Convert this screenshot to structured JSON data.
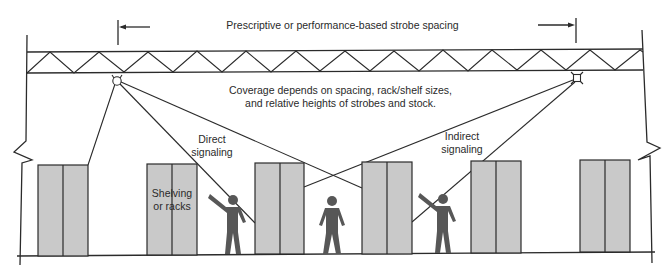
{
  "diagram": {
    "labels": {
      "spacing": "Prescriptive or performance-based strobe spacing",
      "coverage_line1": "Coverage depends on spacing, rack/shelf sizes,",
      "coverage_line2": "and relative heights of strobes and stock.",
      "direct_line1": "Direct",
      "direct_line2": "signaling",
      "indirect_line1": "Indirect",
      "indirect_line2": "signaling",
      "shelving_line1": "Shelving",
      "shelving_line2": "or racks"
    },
    "elements": {
      "strobes": [
        {
          "id": "strobe-left",
          "x": 117,
          "y": 81
        },
        {
          "id": "strobe-right",
          "x": 577,
          "y": 78
        }
      ],
      "racks": [
        {
          "id": "rack-1",
          "x": 38,
          "width": 50
        },
        {
          "id": "rack-2",
          "x": 147,
          "width": 50
        },
        {
          "id": "rack-3",
          "x": 255,
          "width": 49
        },
        {
          "id": "rack-4",
          "x": 362,
          "width": 50
        },
        {
          "id": "rack-5",
          "x": 471,
          "width": 50
        },
        {
          "id": "rack-6",
          "x": 580,
          "width": 50
        }
      ],
      "people": [
        {
          "id": "person-pointing-left",
          "x": 232,
          "pose": "pointing"
        },
        {
          "id": "person-standing",
          "x": 331,
          "pose": "standing"
        },
        {
          "id": "person-pointing-right",
          "x": 442,
          "pose": "pointing"
        }
      ]
    },
    "colors": {
      "line": "#2b2b2b",
      "rack_fill": "#c9c9c9",
      "person_fill": "#575757",
      "background": "#ffffff"
    }
  }
}
